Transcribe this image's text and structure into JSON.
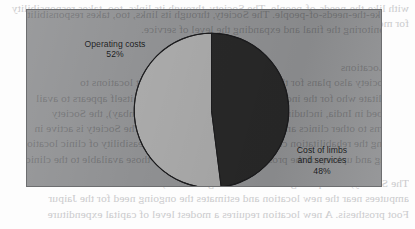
{
  "chart_data": {
    "type": "pie",
    "title": "",
    "subtitle": "",
    "xlabel": "",
    "ylabel": "",
    "legend_position": "none",
    "grid": false,
    "units": "percent",
    "total": 100,
    "categories": [
      "Operating costs",
      "Cost of limbs and services"
    ],
    "values": [
      52,
      48
    ],
    "slices": [
      {
        "name": "Operating costs",
        "value": 52,
        "value_label": "52%",
        "color": "#a9a9a9",
        "label_lines": [
          "Operating costs",
          "52%"
        ],
        "label_position": "outside-upper-left",
        "start_angle_deg": 0,
        "end_angle_deg": 187.2,
        "direction": "counter-clockwise"
      },
      {
        "name": "Cost of limbs and services",
        "value": 48,
        "value_label": "48%",
        "color": "#282828",
        "label_lines": [
          "Cost of limbs",
          "and services",
          "48%"
        ],
        "label_position": "outside-lower-right",
        "start_angle_deg": 0,
        "end_angle_deg": 172.8,
        "direction": "clockwise"
      }
    ],
    "annotations": []
  },
  "labels": {
    "operating_costs_line1": "Operating costs",
    "operating_costs_line2": "52%",
    "cost_of_limbs_line1": "Cost of limbs",
    "cost_of_limbs_line2": "and services",
    "cost_of_limbs_line3": "48%"
  },
  "colors": {
    "page_background": "#fdfdfd",
    "plot_background": "#8f9092",
    "plot_border": "#6d6e70",
    "slice_light": "#a9a9a9",
    "slice_dark": "#282828",
    "slice_outline": "#1c1c1e",
    "label_text": "#111214",
    "bleed_text": "#c9c9cb"
  },
  "page_bleed_through": {
    "note": "faint mirrored text showing through from the reverse side of the scanned page",
    "top_lines": [
      "with like-the-needs-of-people.  The Society, through its links, too, takes responsibility",
      "for monitoring the  final and  expanding the level of service."
    ],
    "middle_lines": [
      "New Locations",
      "The Society  also plans  for the  installation  of new  permanent locations  to",
      "rehabilitate who for the  individuals who warrant the  Society itself appears to avail",
      "described in India,  including in  Bangalore  and  Mumbai  (Bombay),  the Society",
      "concerns to other clinics and centers where to supplement.  The Society is active in",
      "assisting the  rehabilitation centers and in determining the  feasibility of clinic location,",
      "training and  upkeep of the  prosthetic materials  to supply  those available  to the clinic."
    ],
    "bottom_lines": [
      "The Society,  as enquiring  of the  central  organization,  studies the  number of",
      "amputees near the  new location  and estimates the  ongoing need  for the  Jaipur",
      "Foot prosthesis.  A new location  requires a modest level  of capital expenditure"
    ]
  }
}
